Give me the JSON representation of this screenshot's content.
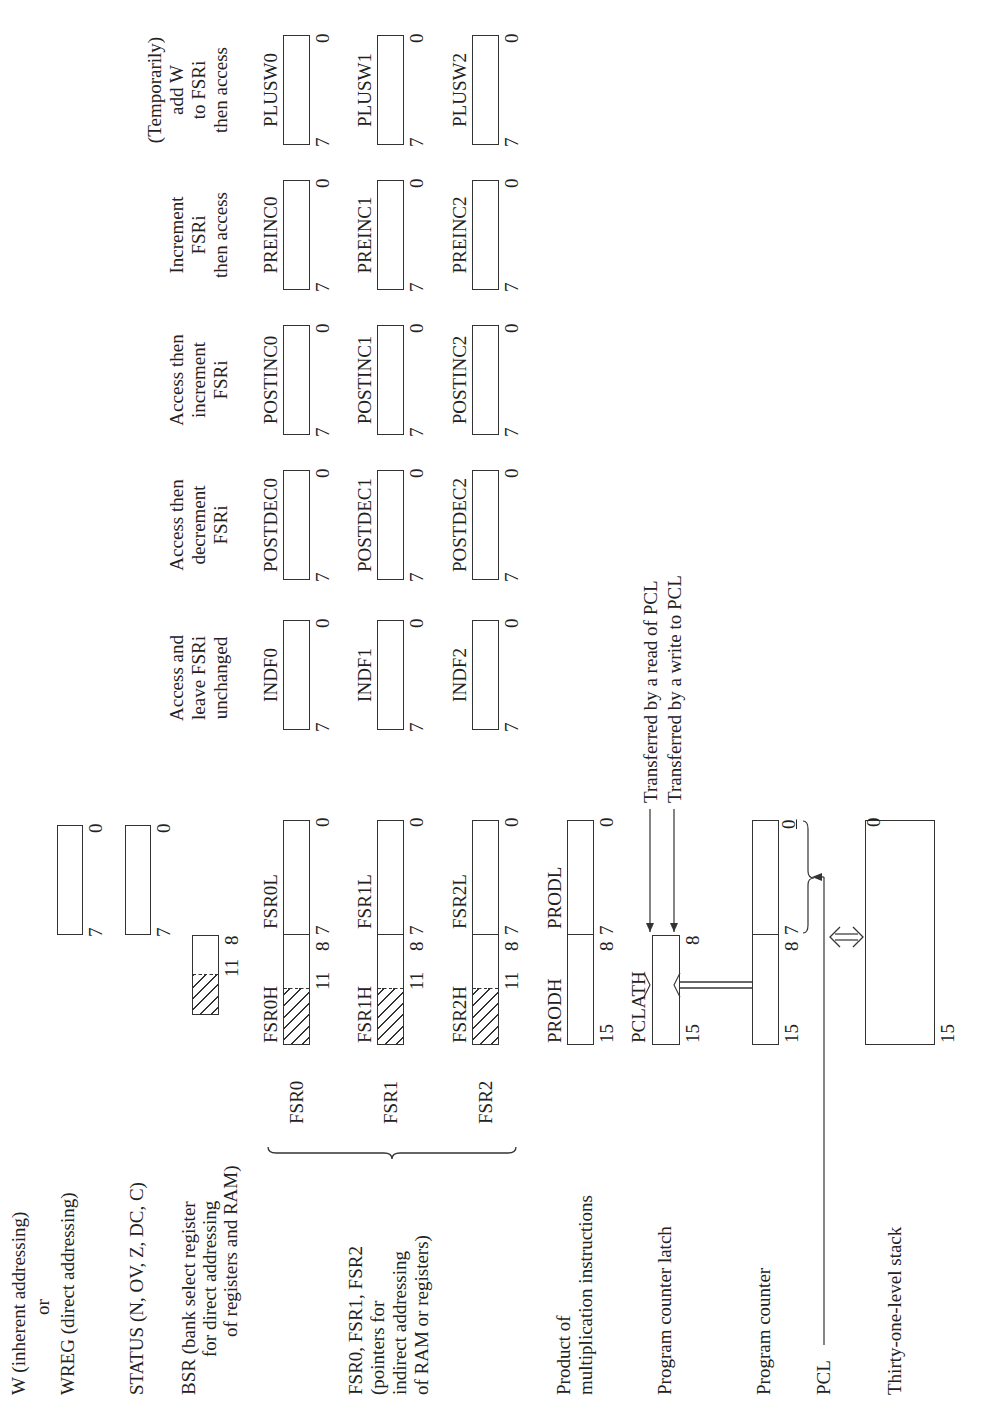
{
  "left_labels": {
    "w": [
      "W (inherent addressing)",
      "or",
      "WREG (direct addressing)"
    ],
    "status": "STATUS (N, OV, Z, DC, C)",
    "bsr": [
      "BSR (bank select register",
      "for direct addressing",
      "of registers and RAM)"
    ],
    "fsr": [
      "FSR0, FSR1, FSR2",
      "(pointers for",
      "indirect addressing",
      "of RAM or registers)"
    ],
    "prod": [
      "Product of",
      "multiplication instructions"
    ],
    "pclath": "Program counter latch",
    "pc": "Program counter",
    "pcl": "PCL",
    "stack": "Thirty-one-level stack"
  },
  "registers": {
    "w": {
      "hi": "7",
      "lo": "0"
    },
    "status": {
      "hi": "7",
      "lo": "0"
    },
    "bsr": {
      "hi": "11",
      "lo": "8"
    },
    "fsr": [
      {
        "name": "FSR0",
        "high": "FSR0H",
        "low": "FSR0L",
        "b11": "11",
        "b8": "8",
        "b7": "7",
        "b0": "0"
      },
      {
        "name": "FSR1",
        "high": "FSR1H",
        "low": "FSR1L",
        "b11": "11",
        "b8": "8",
        "b7": "7",
        "b0": "0"
      },
      {
        "name": "FSR2",
        "high": "FSR2H",
        "low": "FSR2L",
        "b11": "11",
        "b8": "8",
        "b7": "7",
        "b0": "0"
      }
    ],
    "prod": {
      "high": "PRODH",
      "low": "PRODL",
      "b15": "15",
      "b8": "8",
      "b7": "7",
      "b0": "0"
    },
    "pclath": {
      "name": "PCLATH",
      "b15": "15",
      "b8": "8"
    },
    "pc": {
      "b15": "15",
      "b8": "8",
      "b7": "7",
      "b0": "0"
    },
    "stack": {
      "b15": "15",
      "b0": "0"
    }
  },
  "transfers": {
    "read": "Transferred by a read of PCL",
    "write": "Transferred by a write to PCL"
  },
  "indirect_columns": [
    {
      "header": [
        "Access and",
        "leave FSRi",
        "unchanged"
      ],
      "regs": [
        "INDF0",
        "INDF1",
        "INDF2"
      ]
    },
    {
      "header": [
        "Access then",
        "decrement",
        "FSRi"
      ],
      "regs": [
        "POSTDEC0",
        "POSTDEC1",
        "POSTDEC2"
      ]
    },
    {
      "header": [
        "Access then",
        "increment",
        "FSRi"
      ],
      "regs": [
        "POSTINC0",
        "POSTINC1",
        "POSTINC2"
      ]
    },
    {
      "header": [
        "Increment",
        "FSRi",
        "then access"
      ],
      "regs": [
        "PREINC0",
        "PREINC1",
        "PREINC2"
      ]
    },
    {
      "header": [
        "(Temporarily)",
        "add W",
        "to FSRi",
        "then access"
      ],
      "regs": [
        "PLUSW0",
        "PLUSW1",
        "PLUSW2"
      ]
    }
  ],
  "bit_labels": {
    "hi": "7",
    "lo": "0"
  }
}
